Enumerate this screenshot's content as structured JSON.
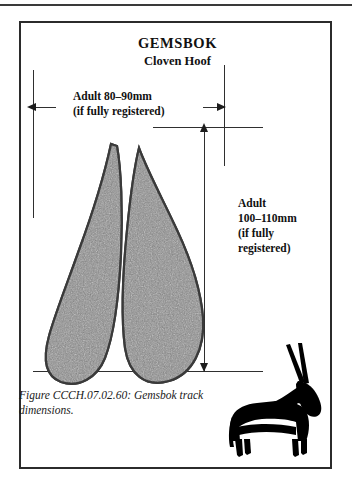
{
  "figure": {
    "title": "GEMSBOK",
    "subtitle": "Cloven Hoof",
    "caption": "Figure CCCH.07.02.60:  Gemsbok track dimensions."
  },
  "dimensions": {
    "width_label": "Adult 80–90mm\n(if fully registered)",
    "height_label": "Adult\n100–110mm\n(if fully\nregistered)"
  },
  "icons": {
    "arrow_left": "arrow-left-icon",
    "arrow_right": "arrow-right-icon",
    "arrow_up": "arrow-up-icon",
    "arrow_down": "arrow-down-icon",
    "hoof": "cloven-hoof-track-icon",
    "animal": "gemsbok-silhouette-icon"
  },
  "colors": {
    "frame": "#2b2b2b",
    "line": "#2f2f2f",
    "arrow": "#1d1d1d",
    "hoof_fill": "#8c8c8c",
    "hoof_outline": "#3d3d3d",
    "silhouette": "#000000",
    "page": "#ffffff"
  }
}
